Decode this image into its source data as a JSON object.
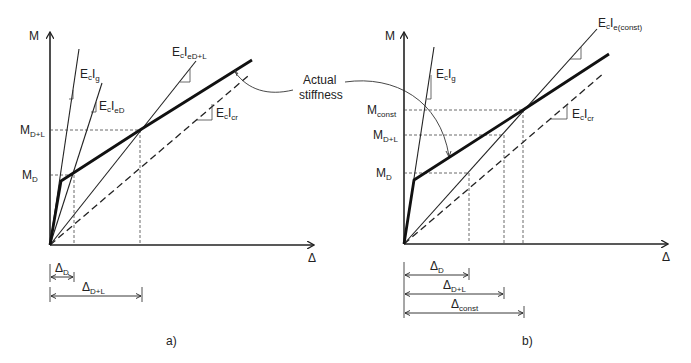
{
  "figure": {
    "panel_a": {
      "caption": "a)",
      "axis_y_label": "M",
      "axis_x_label": "Δ",
      "y_ticks": [
        {
          "main": "M",
          "sub": "D+L"
        },
        {
          "main": "M",
          "sub": "D"
        }
      ],
      "line_labels": [
        {
          "main": "E",
          "sub1": "c",
          "main2": "I",
          "sub2": "g"
        },
        {
          "main": "E",
          "sub1": "c",
          "main2": "I",
          "sub2": "eD"
        },
        {
          "main": "E",
          "sub1": "c",
          "main2": "I",
          "sub2": "eD+L"
        },
        {
          "main": "E",
          "sub1": "c",
          "main2": "I",
          "sub2": "cr"
        }
      ],
      "dimensions": [
        {
          "main": "Δ",
          "sub": "D"
        },
        {
          "main": "Δ",
          "sub": "D+L"
        }
      ]
    },
    "panel_b": {
      "caption": "b)",
      "axis_y_label": "M",
      "axis_x_label": "Δ",
      "y_ticks": [
        {
          "main": "M",
          "sub": "const"
        },
        {
          "main": "M",
          "sub": "D+L"
        },
        {
          "main": "M",
          "sub": "D"
        }
      ],
      "line_labels": [
        {
          "main": "E",
          "sub1": "c",
          "main2": "I",
          "sub2": "g"
        },
        {
          "main": "E",
          "sub1": "c",
          "main2": "I",
          "sub2": "e(const)"
        },
        {
          "main": "E",
          "sub1": "c",
          "main2": "I",
          "sub2": "cr"
        }
      ],
      "dimensions": [
        {
          "main": "Δ",
          "sub": "D"
        },
        {
          "main": "Δ",
          "sub": "D+L"
        },
        {
          "main": "Δ",
          "sub": "const"
        }
      ]
    },
    "annotation": {
      "line1": "Actual",
      "line2": "stiffness"
    }
  }
}
